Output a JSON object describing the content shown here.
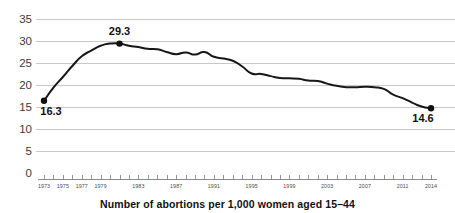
{
  "chart_data": {
    "type": "line",
    "title": "",
    "subtitle": "",
    "caption": "Number of abortions per 1,000 women aged 15–44",
    "xlabel": "",
    "ylabel": "",
    "ylim": [
      0,
      35
    ],
    "xlim": [
      1973,
      2014
    ],
    "grid": true,
    "legend": false,
    "y_ticks": [
      0,
      5,
      10,
      15,
      20,
      25,
      30,
      35
    ],
    "y_tick_labels": [
      "0",
      "5",
      "10",
      "15",
      "20",
      "25",
      "30",
      "35"
    ],
    "x_tick_years": [
      1973,
      1974,
      1975,
      1976,
      1977,
      1978,
      1979,
      1980,
      1981,
      1982,
      1983,
      1984,
      1985,
      1986,
      1987,
      1988,
      1989,
      1990,
      1991,
      1992,
      1993,
      1994,
      1995,
      1996,
      1997,
      1998,
      1999,
      2000,
      2001,
      2002,
      2003,
      2004,
      2005,
      2006,
      2007,
      2008,
      2009,
      2010,
      2011,
      2012,
      2013,
      2014
    ],
    "x_tick_labels": [
      {
        "year": 1973,
        "label": "1973"
      },
      {
        "year": 1975,
        "label": "1975"
      },
      {
        "year": 1977,
        "label": "1977"
      },
      {
        "year": 1979,
        "label": "1979"
      },
      {
        "year": 1983,
        "label": "1983"
      },
      {
        "year": 1987,
        "label": "1987"
      },
      {
        "year": 1991,
        "label": "1991"
      },
      {
        "year": 1995,
        "label": "1995"
      },
      {
        "year": 1999,
        "label": "1999"
      },
      {
        "year": 2003,
        "label": "2003"
      },
      {
        "year": 2007,
        "label": "2007"
      },
      {
        "year": 2011,
        "label": "2011"
      },
      {
        "year": 2014,
        "label": "2014"
      }
    ],
    "x": [
      1973,
      1974,
      1975,
      1976,
      1977,
      1978,
      1979,
      1980,
      1981,
      1982,
      1983,
      1984,
      1985,
      1986,
      1987,
      1988,
      1989,
      1990,
      1991,
      1992,
      1993,
      1994,
      1995,
      1996,
      1997,
      1998,
      1999,
      2000,
      2001,
      2002,
      2003,
      2004,
      2005,
      2006,
      2007,
      2008,
      2009,
      2010,
      2011,
      2012,
      2013,
      2014
    ],
    "values": [
      16.3,
      19.3,
      21.7,
      24.2,
      26.4,
      27.7,
      28.8,
      29.3,
      29.3,
      28.8,
      28.5,
      28.1,
      28.0,
      27.4,
      26.9,
      27.3,
      26.8,
      27.4,
      26.3,
      25.9,
      25.4,
      24.1,
      22.5,
      22.4,
      21.9,
      21.5,
      21.4,
      21.3,
      20.9,
      20.8,
      20.2,
      19.7,
      19.4,
      19.4,
      19.5,
      19.4,
      19.0,
      17.7,
      16.9,
      15.9,
      15.0,
      14.6
    ],
    "annotations": [
      {
        "year": 1973,
        "value": 16.3,
        "label": "16.3",
        "position": "below-right"
      },
      {
        "year": 1981,
        "value": 29.3,
        "label": "29.3",
        "position": "above"
      },
      {
        "year": 2014,
        "value": 14.6,
        "label": "14.6",
        "position": "below-left"
      }
    ],
    "markers": [
      {
        "year": 1973,
        "value": 16.3
      },
      {
        "year": 1981,
        "value": 29.3
      },
      {
        "year": 2014,
        "value": 14.6
      }
    ],
    "series_color": "#171717",
    "grid_color": "#c8c8c8",
    "background": "#ffffff"
  }
}
